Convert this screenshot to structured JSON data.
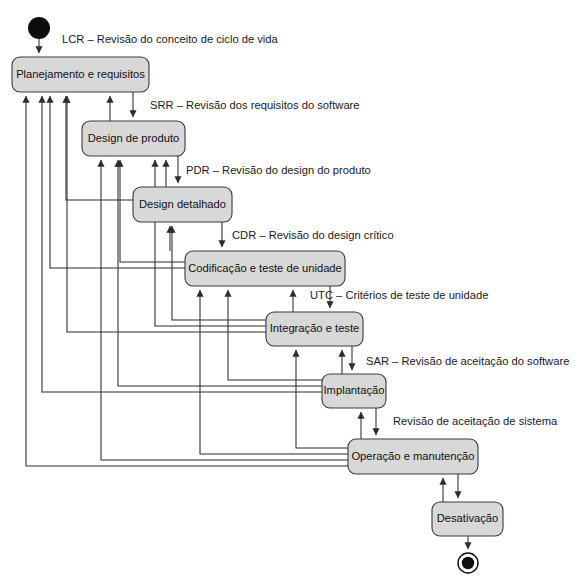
{
  "diagram": {
    "type": "uml-state-machine",
    "canvas": {
      "width": 575,
      "height": 584
    },
    "colors": {
      "state_fill": "#d8d8d8",
      "state_stroke": "#3a3a3a",
      "edge_stroke": "#2d2d2d",
      "node_fill": "#0d0d0d",
      "background": "#ffffff",
      "text": "#111111"
    },
    "initial_node": {
      "name": "initial-state-node",
      "cx": 39,
      "cy": 28,
      "r": 11
    },
    "final_node": {
      "name": "final-state-node",
      "cx": 468,
      "cy": 563,
      "r_outer": 10,
      "r_inner": 6.2
    },
    "states": [
      {
        "id": "planejamento",
        "label": "Planejamento e requisitos",
        "x": 12,
        "y": 57,
        "w": 137,
        "h": 35
      },
      {
        "id": "design-produto",
        "label": "Design de produto",
        "x": 82,
        "y": 121,
        "w": 103,
        "h": 35
      },
      {
        "id": "design-detalhado",
        "label": "Design detalhado",
        "x": 133,
        "y": 187,
        "w": 99,
        "h": 35
      },
      {
        "id": "codificacao",
        "label": "Codificação e teste de unidade",
        "x": 185,
        "y": 251,
        "w": 160,
        "h": 35
      },
      {
        "id": "integracao",
        "label": "Integração e teste",
        "x": 266,
        "y": 312,
        "w": 97,
        "h": 34
      },
      {
        "id": "implantacao",
        "label": "Implantação",
        "x": 322,
        "y": 374,
        "w": 64,
        "h": 34
      },
      {
        "id": "operacao",
        "label": "Operação e manutenção",
        "x": 348,
        "y": 439,
        "w": 130,
        "h": 35
      },
      {
        "id": "desativacao",
        "label": "Desativação",
        "x": 432,
        "y": 502,
        "w": 71,
        "h": 34
      }
    ],
    "transition_labels": [
      {
        "id": "lcr",
        "text": "LCR – Revisão do conceito de ciclo de vida",
        "x": 62,
        "y": 40
      },
      {
        "id": "srr",
        "text": "SRR – Revisão dos requisitos do software",
        "x": 150,
        "y": 106
      },
      {
        "id": "pdr",
        "text": "PDR – Revisão do design do produto",
        "x": 186,
        "y": 171
      },
      {
        "id": "cdr",
        "text": "CDR – Revisão do design crítico",
        "x": 232,
        "y": 236
      },
      {
        "id": "utc",
        "text": "UTC – Critérios de teste de unidade",
        "x": 310,
        "y": 296
      },
      {
        "id": "sar",
        "text": "SAR – Revisão de aceitação do software",
        "x": 366,
        "y": 362
      },
      {
        "id": "sys",
        "text": "Revisão de aceitação de sistema",
        "x": 393,
        "y": 422
      }
    ],
    "forward_transitions": [
      {
        "from": "initial-state-node",
        "to": "planejamento"
      },
      {
        "from": "planejamento",
        "to": "design-produto"
      },
      {
        "from": "design-produto",
        "to": "design-detalhado"
      },
      {
        "from": "design-detalhado",
        "to": "codificacao"
      },
      {
        "from": "codificacao",
        "to": "integracao"
      },
      {
        "from": "integracao",
        "to": "implantacao"
      },
      {
        "from": "implantacao",
        "to": "operacao"
      },
      {
        "from": "operacao",
        "to": "desativacao"
      },
      {
        "from": "desativacao",
        "to": "final-state-node"
      }
    ],
    "feedback_transitions": [
      {
        "from": "design-produto",
        "to": "planejamento"
      },
      {
        "from": "design-detalhado",
        "to": "planejamento"
      },
      {
        "from": "design-detalhado",
        "to": "design-produto"
      },
      {
        "from": "codificacao",
        "to": "planejamento"
      },
      {
        "from": "codificacao",
        "to": "design-produto"
      },
      {
        "from": "codificacao",
        "to": "design-detalhado"
      },
      {
        "from": "integracao",
        "to": "planejamento"
      },
      {
        "from": "integracao",
        "to": "design-produto"
      },
      {
        "from": "integracao",
        "to": "design-detalhado"
      },
      {
        "from": "integracao",
        "to": "codificacao"
      },
      {
        "from": "implantacao",
        "to": "planejamento"
      },
      {
        "from": "implantacao",
        "to": "design-produto"
      },
      {
        "from": "implantacao",
        "to": "codificacao"
      },
      {
        "from": "implantacao",
        "to": "integracao"
      },
      {
        "from": "operacao",
        "to": "planejamento"
      },
      {
        "from": "operacao",
        "to": "design-produto"
      },
      {
        "from": "operacao",
        "to": "codificacao"
      },
      {
        "from": "operacao",
        "to": "integracao"
      },
      {
        "from": "operacao",
        "to": "implantacao"
      },
      {
        "from": "desativacao",
        "to": "operacao"
      }
    ]
  },
  "caption": {
    "text": ""
  }
}
